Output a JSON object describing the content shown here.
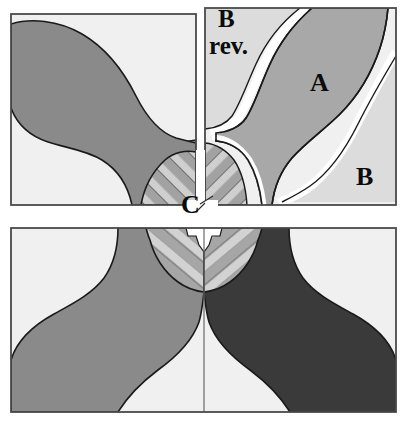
{
  "figure": {
    "title": "",
    "background_color": "#ffffff",
    "panels": [
      {
        "id": "top-left",
        "name": "top-left-panel",
        "x": 11,
        "y": 14,
        "width": 185,
        "height": 191,
        "background_color": "#f0f0f0",
        "border_color": "#4a4a4a"
      },
      {
        "id": "top-right",
        "name": "top-right-panel",
        "x": 205,
        "y": 8,
        "width": 191,
        "height": 197,
        "background_color": "#f0f0f0",
        "border_color": "#4a4a4a"
      },
      {
        "id": "bottom",
        "name": "bottom-panel",
        "x": 11,
        "y": 228,
        "width": 385,
        "height": 184,
        "background_color": "#f0f0f0",
        "border_color": "#4a4a4a"
      }
    ],
    "labels": {
      "b_rev_line1": "B",
      "b_rev_line2": "rev.",
      "a": "A",
      "b": "B",
      "c": "C"
    },
    "colors": {
      "background": "#ffffff",
      "panel_fill": "#f0f0f0",
      "light_gray": "#dcdcdc",
      "mid_light_gray": "#b4b4b4",
      "medium_gray": "#8a8a8a",
      "dark_gray": "#3a3a3a",
      "outline": "#1a1a1a",
      "panel_border": "#4a4a4a",
      "white_channel": "#ffffff"
    },
    "regions": [
      {
        "name": "top-left-leaf",
        "panel": "top-left",
        "fill": "#8a8a8a"
      },
      {
        "name": "top-left-hatched-wedge",
        "panel": "top-left",
        "fill": "striped light/medium gray"
      },
      {
        "name": "domain-a-lobe",
        "panel": "top-right",
        "fill": "#a8a8a8",
        "label": "A"
      },
      {
        "name": "domain-b-region",
        "panel": "top-right",
        "fill": "#dcdcdc",
        "label": "B"
      },
      {
        "name": "domain-b-rev-region",
        "panel": "top-right",
        "fill": "#dcdcdc",
        "label": "B rev."
      },
      {
        "name": "top-right-hatched-wedge",
        "panel": "top-right",
        "fill": "striped light/medium gray"
      },
      {
        "name": "bottom-left-leaf",
        "panel": "bottom",
        "fill": "#8a8a8a"
      },
      {
        "name": "bottom-right-leaf",
        "panel": "bottom",
        "fill": "#3a3a3a"
      },
      {
        "name": "bottom-chevron-hatched-wedge",
        "panel": "bottom",
        "fill": "striped light/medium gray"
      }
    ],
    "leader_line": {
      "name": "c-leader-line",
      "from_label": "C",
      "description": "short diagonal tick from the C label toward the upper-right central junction"
    },
    "center_divider": {
      "name": "bottom-panel-center-divider",
      "x": 204,
      "color": "#6a6a6a"
    }
  }
}
